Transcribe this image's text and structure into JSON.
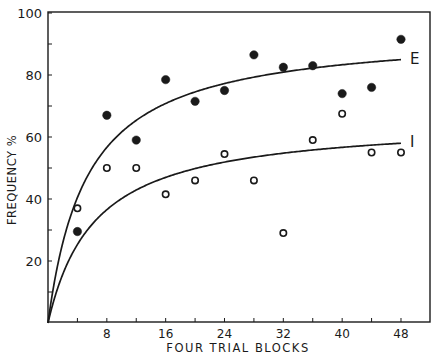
{
  "chart_data": {
    "type": "scatter",
    "title": "",
    "xlabel": "FOUR TRIAL BLOCKS",
    "ylabel": "FREQUENCY %",
    "xlim": [
      0,
      52
    ],
    "ylim": [
      0,
      100
    ],
    "x_ticks": [
      4,
      8,
      12,
      16,
      20,
      24,
      28,
      32,
      36,
      40,
      44,
      48
    ],
    "x_tick_labels": [
      "8",
      "16",
      "24",
      "32",
      "40",
      "48"
    ],
    "x_tick_label_values": [
      8,
      16,
      24,
      32,
      40,
      48
    ],
    "y_ticks": [
      10,
      20,
      30,
      40,
      50,
      60,
      70,
      80,
      90,
      100
    ],
    "y_tick_labels": [
      "20",
      "40",
      "60",
      "80",
      "100"
    ],
    "y_tick_label_values": [
      20,
      40,
      60,
      80,
      100
    ],
    "grid": false,
    "legend": "none (curves labeled directly)",
    "series": [
      {
        "name": "E",
        "marker": "filled-circle",
        "x": [
          4,
          8,
          12,
          16,
          20,
          24,
          28,
          32,
          36,
          40,
          44,
          48
        ],
        "values": [
          29.5,
          67,
          59,
          78.5,
          71.5,
          75,
          86.5,
          82.5,
          83,
          74,
          76,
          91.5
        ],
        "fit_curve": {
          "label": "E",
          "form": "a*x/(b+x)",
          "a": 94.4,
          "b": 5.33,
          "end_value": 85
        }
      },
      {
        "name": "I",
        "marker": "open-circle",
        "x": [
          4,
          8,
          12,
          16,
          20,
          24,
          28,
          32,
          36,
          40,
          44,
          48
        ],
        "values": [
          37,
          50,
          50,
          41.5,
          46,
          54.5,
          46,
          29,
          59,
          67.5,
          55,
          55
        ],
        "fit_curve": {
          "label": "I",
          "form": "a*x/(b+x)",
          "a": 65.7,
          "b": 6.38,
          "end_value": 58
        }
      }
    ]
  },
  "colors": {
    "ink": "#1a1a1a",
    "background": "#ffffff"
  }
}
